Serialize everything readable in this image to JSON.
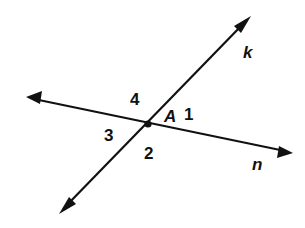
{
  "diagram": {
    "colors": {
      "stroke": "#111111",
      "background": "#ffffff"
    },
    "point": {
      "label": "A",
      "x": 148,
      "y": 124
    },
    "lines": [
      {
        "label": "k",
        "from": [
          59,
          214
        ],
        "to": [
          251,
          16
        ]
      },
      {
        "label": "n",
        "from": [
          26,
          97
        ],
        "to": [
          293,
          153
        ]
      }
    ],
    "angles": [
      {
        "label": "1"
      },
      {
        "label": "2"
      },
      {
        "label": "3"
      },
      {
        "label": "4"
      }
    ]
  }
}
